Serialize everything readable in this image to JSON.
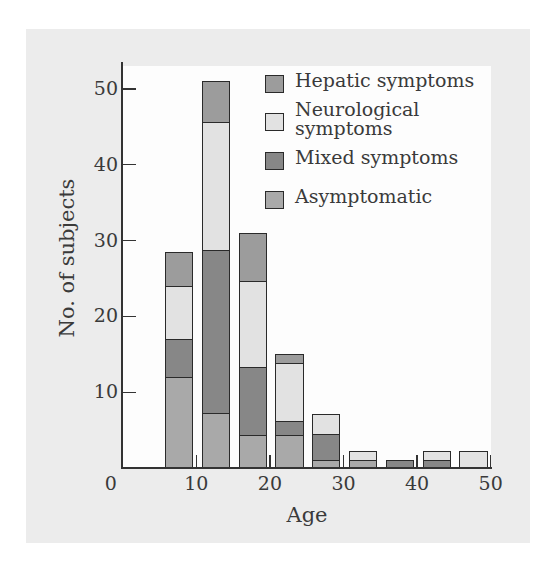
{
  "chart_data": {
    "type": "bar",
    "stacked": true,
    "title": "",
    "xlabel": "Age",
    "ylabel": "No. of subjects",
    "xlim": [
      0,
      50
    ],
    "ylim": [
      0,
      53
    ],
    "x_ticks": [
      "0",
      "10",
      "20",
      "30",
      "40",
      "50"
    ],
    "y_ticks": [
      "10",
      "20",
      "30",
      "40",
      "50"
    ],
    "grid": false,
    "legend_position": "upper right (inside plot)",
    "categories": [
      "5-10",
      "10-15",
      "15-20",
      "20-25",
      "25-30",
      "30-35",
      "35-40",
      "40-45",
      "45-50"
    ],
    "series": [
      {
        "name": "Asymptomatic",
        "color": "#a9a9a9",
        "values": [
          12,
          7.2,
          4.3,
          4.3,
          1,
          1.1,
          0,
          0,
          0
        ]
      },
      {
        "name": "Mixed symptoms",
        "color": "#878787",
        "values": [
          5,
          21.5,
          9,
          1.9,
          3.5,
          0,
          1,
          1.1,
          0
        ]
      },
      {
        "name": "Neurological symptoms",
        "color": "#e2e2e2",
        "values": [
          7,
          17,
          11.4,
          7.7,
          2.6,
          1.2,
          0,
          1.2,
          2.3
        ]
      },
      {
        "name": "Hepatic symptoms",
        "color": "#9c9c9c",
        "values": [
          4.5,
          5.3,
          6.3,
          1.1,
          0,
          0,
          0,
          0,
          0
        ]
      }
    ],
    "totals": [
      28.5,
      51,
      31,
      15,
      7.1,
      2.3,
      1,
      2.3,
      2.3
    ]
  },
  "legend": {
    "items": [
      {
        "label": "Hepatic symptoms",
        "color": "#9c9c9c"
      },
      {
        "label_line1": "Neurological",
        "label_line2": "symptoms",
        "color": "#e2e2e2"
      },
      {
        "label": "Mixed symptoms",
        "color": "#878787"
      },
      {
        "label": "Asymptomatic",
        "color": "#a9a9a9"
      }
    ]
  },
  "axes": {
    "xlabel": "Age",
    "ylabel": "No. of subjects",
    "x_tick_labels": [
      "0",
      "10",
      "20",
      "30",
      "40",
      "50"
    ],
    "y_tick_labels": [
      "10",
      "20",
      "30",
      "40",
      "50"
    ]
  }
}
